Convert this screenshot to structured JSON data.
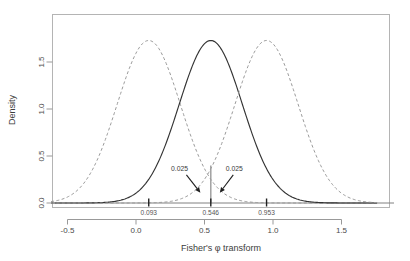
{
  "chart_data": {
    "type": "line",
    "title": "",
    "subtitle": "",
    "xlabel": "Fisher's φ transform",
    "ylabel": "Density",
    "xlim": [
      -0.62,
      1.76
    ],
    "ylim": [
      -0.13,
      1.85
    ],
    "grid": false,
    "legend_position": "none",
    "x_ticks": [
      -0.5,
      0.0,
      0.5,
      1.0,
      1.5
    ],
    "x_tick_labels": [
      "-0.5",
      "0.0",
      "0.5",
      "1.0",
      "1.5"
    ],
    "y_ticks": [
      0.0,
      0.5,
      1.0,
      1.5
    ],
    "y_tick_labels": [
      "0.0",
      "0.5",
      "1.0",
      "1.5"
    ],
    "series": [
      {
        "name": "null-lower",
        "style": "dashed",
        "color": "#9a9a9a",
        "distribution": "normal",
        "mean": 0.093,
        "sd": 0.2308,
        "peak_density": 1.729
      },
      {
        "name": "observed",
        "style": "solid",
        "color": "#333333",
        "distribution": "normal",
        "mean": 0.546,
        "sd": 0.2308,
        "peak_density": 1.729
      },
      {
        "name": "null-upper",
        "style": "dashed",
        "color": "#9a9a9a",
        "distribution": "normal",
        "mean": 0.953,
        "sd": 0.2308,
        "peak_density": 1.729
      }
    ],
    "markers": [
      {
        "label": "0.093",
        "x": 0.093
      },
      {
        "label": "0.546",
        "x": 0.546
      },
      {
        "label": "0.953",
        "x": 0.953
      }
    ],
    "vertical_line": {
      "x": 0.546,
      "y_top": 0.4
    },
    "annotations": [
      {
        "label": "0.025",
        "text_x": 0.318,
        "text_y": 0.345,
        "arrow_from_x": 0.368,
        "arrow_from_y": 0.3,
        "arrow_to_x": 0.47,
        "arrow_to_y": 0.11
      },
      {
        "label": "0.025",
        "text_x": 0.718,
        "text_y": 0.345,
        "arrow_from_x": 0.71,
        "arrow_from_y": 0.3,
        "arrow_to_x": 0.612,
        "arrow_to_y": 0.11
      }
    ]
  },
  "axes": {
    "x_title": "Fisher's φ transform",
    "y_title": "Density"
  },
  "colors": {
    "solid_curve": "#333333",
    "dashed_curve": "#9a9a9a",
    "frame": "#b4b4b4",
    "text": "#3c3c3c",
    "baseline": "#808080"
  }
}
